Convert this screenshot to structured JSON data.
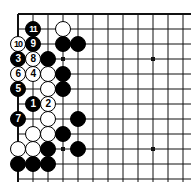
{
  "diagram": {
    "kind": "go-board-diagram",
    "title": "",
    "board": {
      "corner": "top-left",
      "origin_x": 18,
      "origin_y": 14,
      "spacing": 15,
      "columns": 12,
      "rows": 12,
      "line_color": "#111111",
      "edge_color": "#111111",
      "background_color": "#ffffff",
      "stone_radius": 8
    },
    "star_points": [
      {
        "name": "star-point-top-left",
        "col": 3,
        "row": 3
      },
      {
        "name": "star-point-top-right",
        "col": 9,
        "row": 3
      },
      {
        "name": "star-point-bottom-left",
        "col": 3,
        "row": 9
      },
      {
        "name": "star-point-bottom-right",
        "col": 9,
        "row": 9
      }
    ],
    "stones": [
      {
        "id": "stone-move-11",
        "color": "black",
        "col": 1,
        "row": 1,
        "label": "11",
        "move": 11
      },
      {
        "id": "stone-white-c1",
        "color": "white",
        "col": 3,
        "row": 1,
        "label": "",
        "move": null
      },
      {
        "id": "stone-move-10",
        "color": "white",
        "col": 0,
        "row": 2,
        "label": "10",
        "move": 10
      },
      {
        "id": "stone-move-9",
        "color": "black",
        "col": 1,
        "row": 2,
        "label": "9",
        "move": 9
      },
      {
        "id": "stone-black-c2",
        "color": "black",
        "col": 3,
        "row": 2,
        "label": "",
        "move": null
      },
      {
        "id": "stone-black-d2",
        "color": "black",
        "col": 4,
        "row": 2,
        "label": "",
        "move": null
      },
      {
        "id": "stone-move-3",
        "color": "black",
        "col": 0,
        "row": 3,
        "label": "3",
        "move": 3
      },
      {
        "id": "stone-move-8",
        "color": "white",
        "col": 1,
        "row": 3,
        "label": "8",
        "move": 8
      },
      {
        "id": "stone-black-b3",
        "color": "black",
        "col": 2,
        "row": 3,
        "label": "",
        "move": null
      },
      {
        "id": "stone-move-6",
        "color": "white",
        "col": 0,
        "row": 4,
        "label": "6",
        "move": 6
      },
      {
        "id": "stone-move-4",
        "color": "white",
        "col": 1,
        "row": 4,
        "label": "4",
        "move": 4
      },
      {
        "id": "stone-white-b4",
        "color": "white",
        "col": 2,
        "row": 4,
        "label": "",
        "move": null
      },
      {
        "id": "stone-black-c4",
        "color": "black",
        "col": 3,
        "row": 4,
        "label": "",
        "move": null
      },
      {
        "id": "stone-move-5",
        "color": "black",
        "col": 0,
        "row": 5,
        "label": "5",
        "move": 5
      },
      {
        "id": "stone-white-b5",
        "color": "white",
        "col": 2,
        "row": 5,
        "label": "",
        "move": null
      },
      {
        "id": "stone-black-c5",
        "color": "black",
        "col": 3,
        "row": 5,
        "label": "",
        "move": null
      },
      {
        "id": "stone-move-1",
        "color": "black",
        "col": 1,
        "row": 6,
        "label": "1",
        "move": 1
      },
      {
        "id": "stone-move-2",
        "color": "white",
        "col": 2,
        "row": 6,
        "label": "2",
        "move": 2
      },
      {
        "id": "stone-move-7",
        "color": "black",
        "col": 0,
        "row": 7,
        "label": "7",
        "move": 7
      },
      {
        "id": "stone-white-b7",
        "color": "white",
        "col": 2,
        "row": 7,
        "label": "",
        "move": null
      },
      {
        "id": "stone-black-d7",
        "color": "black",
        "col": 4,
        "row": 7,
        "label": "",
        "move": null
      },
      {
        "id": "stone-white-a8",
        "color": "white",
        "col": 1,
        "row": 8,
        "label": "",
        "move": null
      },
      {
        "id": "stone-white-b8",
        "color": "white",
        "col": 2,
        "row": 8,
        "label": "",
        "move": null
      },
      {
        "id": "stone-black-c8",
        "color": "black",
        "col": 3,
        "row": 8,
        "label": "",
        "move": null
      },
      {
        "id": "stone-white-a9",
        "color": "white",
        "col": 0,
        "row": 9,
        "label": "",
        "move": null
      },
      {
        "id": "stone-white-b9",
        "color": "white",
        "col": 1,
        "row": 9,
        "label": "",
        "move": null
      },
      {
        "id": "stone-black-c9",
        "color": "black",
        "col": 2,
        "row": 9,
        "label": "",
        "move": null
      },
      {
        "id": "stone-black-e9",
        "color": "black",
        "col": 4,
        "row": 9,
        "label": "",
        "move": null
      },
      {
        "id": "stone-black-a10",
        "color": "black",
        "col": 0,
        "row": 10,
        "label": "",
        "move": null
      },
      {
        "id": "stone-black-b10",
        "color": "black",
        "col": 1,
        "row": 10,
        "label": "",
        "move": null
      },
      {
        "id": "stone-black-c10",
        "color": "black",
        "col": 2,
        "row": 10,
        "label": "",
        "move": null
      }
    ]
  }
}
